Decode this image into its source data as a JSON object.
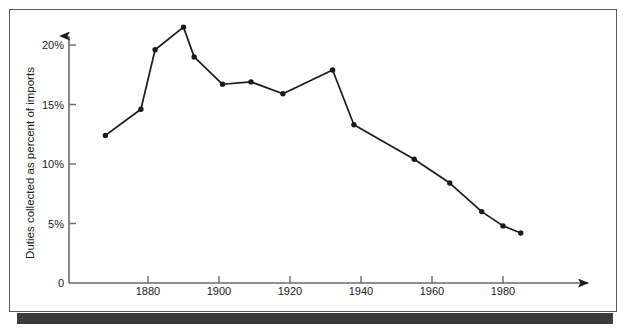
{
  "chart_data": {
    "type": "line",
    "title": "",
    "xlabel": "",
    "ylabel": "Duties collected as percent of imports",
    "xlim": [
      1865,
      1995
    ],
    "ylim": [
      0,
      22.5
    ],
    "grid": false,
    "legend": "none",
    "x_ticks": [
      1880,
      1900,
      1920,
      1940,
      1960,
      1980
    ],
    "x_tick_labels": [
      "1880",
      "1900",
      "1920",
      "1940",
      "1960",
      "1980"
    ],
    "y_ticks": [
      0,
      5,
      10,
      15,
      20
    ],
    "y_tick_labels": [
      "0",
      "5%",
      "10%",
      "15%",
      "20%"
    ],
    "marker": "filled-circle",
    "line_color": "#1a1a1a",
    "marker_color": "#1a1a1a",
    "axis_color": "#6b6b6b",
    "series": [
      {
        "name": "Duties collected as percent of imports",
        "x": [
          1868,
          1878,
          1882,
          1890,
          1893,
          1901,
          1909,
          1918,
          1932,
          1938,
          1955,
          1965,
          1974,
          1980,
          1985
        ],
        "values": [
          12.4,
          14.6,
          19.6,
          21.5,
          19.0,
          16.7,
          16.9,
          15.9,
          17.9,
          13.3,
          10.4,
          8.4,
          6.0,
          4.8,
          4.2
        ]
      }
    ]
  },
  "figure": {
    "y_axis_title": "Duties collected as percent of imports",
    "x_axis_arrow": "arrowhead-right",
    "y_axis_arrow": "arrowhead-up"
  }
}
